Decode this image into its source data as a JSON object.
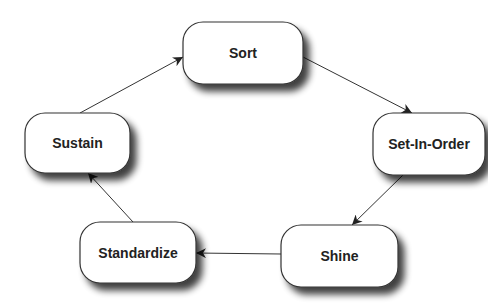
{
  "diagram": {
    "type": "cycle",
    "nodes": [
      {
        "id": "sort",
        "label": "Sort"
      },
      {
        "id": "set-in-order",
        "label": "Set-In-Order"
      },
      {
        "id": "shine",
        "label": "Shine"
      },
      {
        "id": "standardize",
        "label": "Standardize"
      },
      {
        "id": "sustain",
        "label": "Sustain"
      }
    ],
    "edges": [
      {
        "from": "sort",
        "to": "set-in-order"
      },
      {
        "from": "set-in-order",
        "to": "shine"
      },
      {
        "from": "shine",
        "to": "standardize"
      },
      {
        "from": "standardize",
        "to": "sustain"
      },
      {
        "from": "sustain",
        "to": "sort"
      }
    ],
    "colors": {
      "node_fill": "#ffffff",
      "node_stroke": "#333333",
      "edge": "#333333",
      "text": "#222222"
    }
  }
}
